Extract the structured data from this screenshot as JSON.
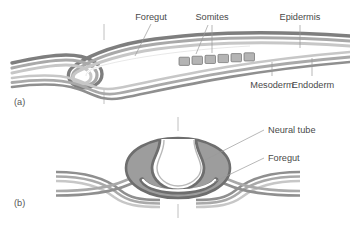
{
  "figure": {
    "type": "biological-diagram",
    "background_color": "#ffffff",
    "panels": [
      {
        "id": "a",
        "label": "(a)",
        "view": "sagittal",
        "description": "Head fold of embryo in longitudinal section showing foregut pocket, somites and germ layers"
      },
      {
        "id": "b",
        "label": "(b)",
        "view": "transverse",
        "description": "Transverse section showing neural tube closing and foregut beneath"
      }
    ]
  },
  "labels": {
    "foregut_a": "Foregut",
    "somites": "Somites",
    "epidermis": "Epidermis",
    "mesoderm": "Mesoderm",
    "endoderm": "Endoderm",
    "neural_tube": "Neural tube",
    "foregut_b": "Foregut"
  },
  "colors": {
    "epidermis_band": "#8a8a8a",
    "mesoderm_band": "#a8a8a8",
    "endoderm_band": "#c9c9c9",
    "body_fill": "#9d9d9d",
    "cavity": "#ffffff",
    "outline": "#6e6e6e",
    "leader_line": "#9a9a9a",
    "text": "#4a4a4a",
    "tick": "#b0b0b0"
  },
  "structures": {
    "somite_count": 6,
    "somite_label_leaders": 2,
    "section_plane_ticks": 4
  }
}
